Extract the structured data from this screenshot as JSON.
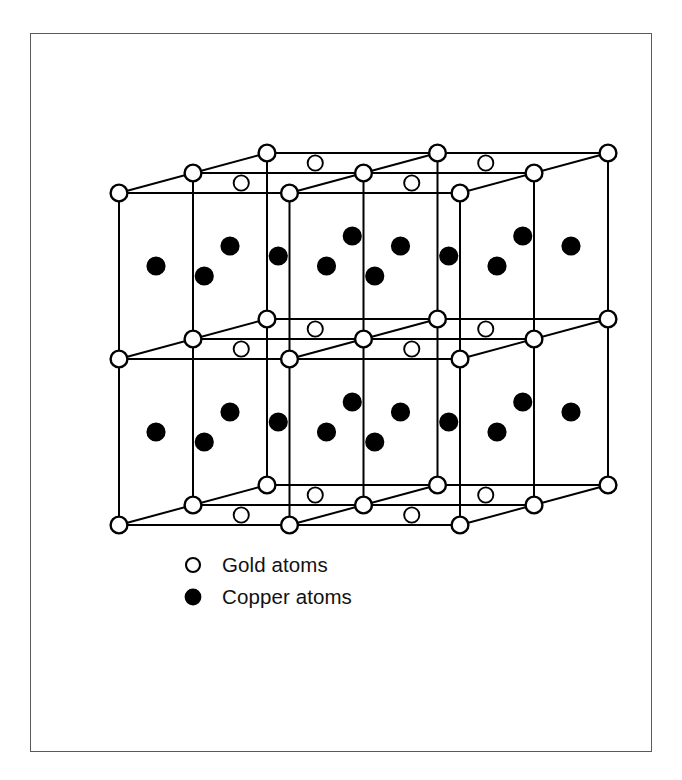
{
  "figure": {
    "frame": {
      "x": 30,
      "y": 33,
      "width": 622,
      "height": 719,
      "stroke": "#5a5a5a"
    }
  },
  "lattice": {
    "origin": {
      "x": 119,
      "y": 525
    },
    "step_x": 170.5,
    "step_y": -166.0,
    "depth_x": 74.0,
    "depth_y": -20.0,
    "cells_x": 2,
    "cells_y": 2,
    "cells_z": 2,
    "line_color": "#000000",
    "line_width": 2.0,
    "atom_radius": 8.4,
    "atom_radius_inner": 7.6,
    "atom_stroke_width": 2.4,
    "atom_stroke_width_inner": 1.9
  },
  "species": {
    "gold": {
      "name": "gold",
      "fill": "#ffffff",
      "stroke": "#000000",
      "layers": [
        0,
        1,
        2
      ]
    },
    "copper": {
      "name": "copper",
      "fill": "#000000",
      "stroke": "#000000",
      "layers": [
        0.5,
        1.5
      ]
    }
  },
  "legend": {
    "items": [
      {
        "marker": "open-circle",
        "label": "Gold atoms",
        "fill": "#ffffff",
        "stroke": "#000000"
      },
      {
        "marker": "filled-circle",
        "label": "Copper atoms",
        "fill": "#000000",
        "stroke": "#000000"
      }
    ]
  },
  "chart_data": {
    "type": "diagram",
    "categories": [
      "Gold atoms",
      "Copper atoms"
    ],
    "values": [
      2,
      2
    ]
  }
}
